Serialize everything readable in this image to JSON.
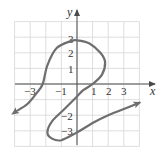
{
  "chart_data": {
    "type": "line",
    "title": "",
    "xlabel": "x",
    "ylabel": "y",
    "xlim": [
      -4,
      4
    ],
    "ylim": [
      -4,
      4
    ],
    "grid": true,
    "x_tick_labels": [
      "-3",
      "-1",
      "1",
      "2",
      "3"
    ],
    "y_tick_labels": [
      "3",
      "2",
      "1",
      "-2",
      "-3"
    ],
    "series": [
      {
        "name": "curve",
        "description": "Parametric curve with arrows at both ends; S-shaped with an upper loop and a lower loop",
        "points": [
          [
            -3.9,
            -1.75
          ],
          [
            -3.2,
            -1.3
          ],
          [
            -2.6,
            -0.6
          ],
          [
            -2.2,
            0.0
          ],
          [
            -1.9,
            1.2
          ],
          [
            -1.3,
            2.3
          ],
          [
            -0.4,
            2.75
          ],
          [
            0.0,
            2.8
          ],
          [
            0.8,
            2.6
          ],
          [
            1.5,
            2.0
          ],
          [
            1.8,
            1.4
          ],
          [
            1.6,
            0.6
          ],
          [
            1.0,
            0.0
          ],
          [
            0.4,
            -0.4
          ],
          [
            0.0,
            -0.8
          ],
          [
            -0.8,
            -1.6
          ],
          [
            -1.6,
            -2.4
          ],
          [
            -1.9,
            -3.1
          ],
          [
            -1.6,
            -3.5
          ],
          [
            -1.0,
            -3.6
          ],
          [
            0.0,
            -3.1
          ],
          [
            1.0,
            -2.5
          ],
          [
            2.0,
            -2.0
          ],
          [
            3.0,
            -1.6
          ],
          [
            4.0,
            -1.2
          ]
        ],
        "start_arrow": true,
        "end_arrow": true
      }
    ]
  },
  "axes": {
    "x_label": "x",
    "y_label": "y",
    "x_ticks": [
      {
        "label": "−3",
        "value": -3
      },
      {
        "label": "−1",
        "value": -1
      },
      {
        "label": "1",
        "value": 1
      },
      {
        "label": "2",
        "value": 2
      },
      {
        "label": "3",
        "value": 3
      }
    ],
    "y_ticks": [
      {
        "label": "3",
        "value": 3
      },
      {
        "label": "2",
        "value": 2
      },
      {
        "label": "1",
        "value": 1
      },
      {
        "label": "−2",
        "value": -2
      },
      {
        "label": "−3",
        "value": -3
      }
    ]
  },
  "colors": {
    "curve": "#6e6e6e",
    "grid": "#d6d6d6",
    "axis": "#4a4a4a"
  }
}
